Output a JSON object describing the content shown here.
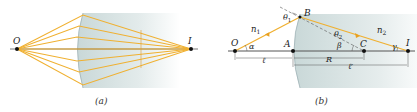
{
  "panel_a": {
    "caption": "(a)",
    "object_label": "O",
    "image_label": "I"
  },
  "panel_b": {
    "caption": "(b)",
    "labels": {
      "object": "O",
      "vertex": "A",
      "incidence_point": "B",
      "center": "C",
      "image": "I",
      "n1": "n",
      "n1_sub": "1",
      "n2": "n",
      "n2_sub": "2",
      "alpha": "α",
      "beta": "β",
      "gamma": "γ",
      "theta1": "θ",
      "theta1_sub": "1",
      "theta2": "θ",
      "theta2_sub": "2",
      "object_distance": "ℓ",
      "radius": "R",
      "image_distance": "ℓ′"
    }
  },
  "colors": {
    "ray": "#f0b030",
    "medium": "#dfe8e8",
    "axis": "#555555",
    "point": "#111111"
  }
}
